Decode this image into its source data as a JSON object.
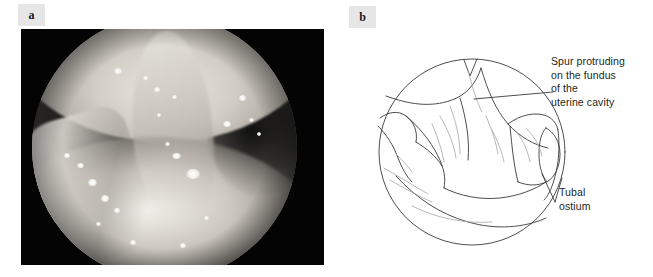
{
  "figure": {
    "type": "two-panel-medical-figure",
    "panels": [
      {
        "id": "a",
        "label": "a",
        "kind": "hysteroscopic-photograph"
      },
      {
        "id": "b",
        "label": "b",
        "kind": "line-drawing-schematic"
      }
    ]
  },
  "panel_a": {
    "label": "a",
    "description": "Grayscale hysteroscopic photograph of the uterine cavity seen through a circular endoscope field",
    "background_color": "#040404"
  },
  "panel_b": {
    "label": "b",
    "description": "Schematic line drawing of the hysteroscopic view",
    "line_color": "#3a3a3a",
    "faint_line_color": "#a9a5a2",
    "annotations": [
      {
        "name": "spur",
        "text": "Spur protruding\non the fundus\nof the\nuterine cavity",
        "leader": "horizontal line from drawing to text"
      },
      {
        "name": "tubal-ostium",
        "text": "Tubal\nostium",
        "leader": "angled line from ostium to text"
      }
    ]
  }
}
